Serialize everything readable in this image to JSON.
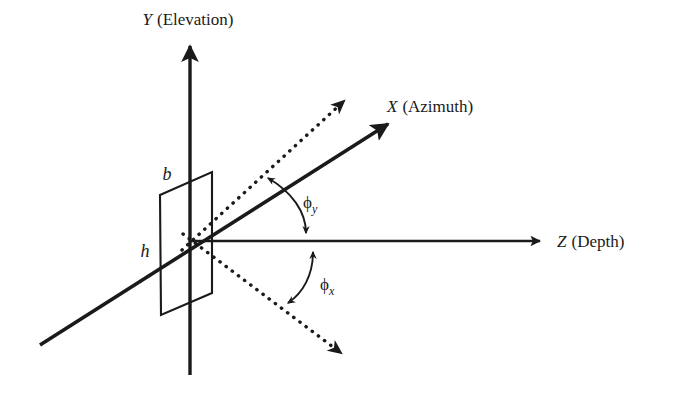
{
  "diagram": {
    "background_color": "#ffffff",
    "stroke_color": "#1a1a1a",
    "axes": [
      {
        "id": "y-axis",
        "symbol": "Y",
        "name": "(Elevation)",
        "label": "Y (Elevation)",
        "style": "solid",
        "direction": "up"
      },
      {
        "id": "x-axis",
        "symbol": "X",
        "name": "(Azimuth)",
        "label": "X (Azimuth)",
        "style": "solid",
        "direction": "up-right"
      },
      {
        "id": "z-axis",
        "symbol": "Z",
        "name": "(Depth)",
        "label": "Z (Depth)",
        "style": "solid",
        "direction": "right"
      }
    ],
    "dimensions": [
      {
        "id": "b",
        "label": "b",
        "description": "plane width"
      },
      {
        "id": "h",
        "label": "h",
        "description": "plane height"
      }
    ],
    "angles": [
      {
        "id": "phi-y",
        "symbol": "ϕ",
        "subscript": "y",
        "label": "ϕy",
        "between": [
          "dotted-upper-ray",
          "z-axis"
        ]
      },
      {
        "id": "phi-x",
        "symbol": "ϕ",
        "subscript": "x",
        "label": "ϕx",
        "between": [
          "z-axis",
          "dotted-lower-ray"
        ]
      }
    ],
    "rays": [
      {
        "id": "dotted-upper-ray",
        "style": "dotted",
        "direction": "up-right"
      },
      {
        "id": "dotted-lower-ray",
        "style": "dotted",
        "direction": "down-right"
      }
    ],
    "plane": {
      "id": "image-plane",
      "shape": "parallelogram",
      "style": "outline"
    }
  }
}
